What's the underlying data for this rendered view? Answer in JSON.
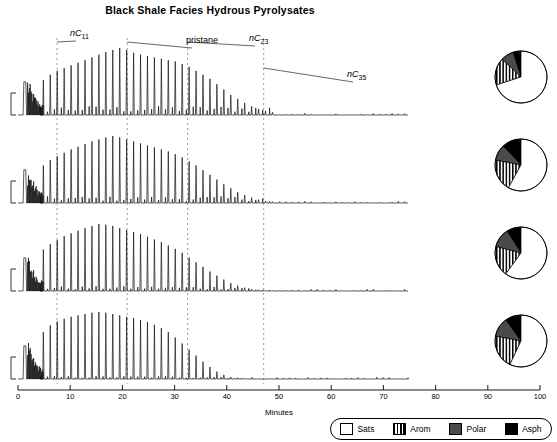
{
  "title": "Black Shale Facies Hydrous Pyrolysates",
  "axis": {
    "xlabel": "Minutes",
    "xticks": [
      0,
      10,
      20,
      30,
      40,
      50,
      60,
      70,
      80,
      90,
      100
    ],
    "xmin": 0,
    "xmax": 100
  },
  "annotations": [
    {
      "name": "nC11",
      "text": "nC",
      "sub": "11",
      "x": 10,
      "label_x": 70,
      "label_y": 28
    },
    {
      "name": "pristane",
      "text": "pristane",
      "sub": "",
      "x": 28,
      "label_x": 186,
      "label_y": 35
    },
    {
      "name": "nC23",
      "text": "nC",
      "sub": "23",
      "x": 43.5,
      "label_x": 249,
      "label_y": 33
    },
    {
      "name": "nC35",
      "text": "nC",
      "sub": "35",
      "x": 63,
      "label_x": 347,
      "label_y": 69
    }
  ],
  "guide_lines": [
    10,
    28,
    43.5,
    63
  ],
  "legend": {
    "items": [
      {
        "key": "sats",
        "label": "Sats"
      },
      {
        "key": "arom",
        "label": "Arom"
      },
      {
        "key": "polar",
        "label": "Polar"
      },
      {
        "key": "asph",
        "label": "Asph"
      }
    ]
  },
  "colors": {
    "trace": "#111111",
    "guide": "#9a9a9a",
    "axis": "#000000",
    "polar": "#4a4a4a",
    "asph": "#000000"
  },
  "chart_data": {
    "type": "line",
    "title": "Black Shale Facies Hydrous Pyrolysates",
    "xlabel": "Minutes",
    "ylabel": "",
    "xlim": [
      0,
      100
    ],
    "grid": false,
    "legend_position": "bottom-right",
    "panels": [
      {
        "name": "300C",
        "label": "300°C/72 hours",
        "alkane_start": 6.5,
        "alkane_spacing": 1.78,
        "alkane_count": 34,
        "unresolved_hump": 0.3,
        "peak_envelope": [
          0.52,
          0.6,
          0.66,
          0.7,
          0.74,
          0.78,
          0.82,
          0.86,
          0.9,
          0.94,
          0.97,
          1.0,
          0.97,
          0.93,
          0.9,
          0.88,
          0.86,
          0.84,
          0.82,
          0.8,
          0.76,
          0.72,
          0.66,
          0.6,
          0.54,
          0.46,
          0.38,
          0.3,
          0.24,
          0.18,
          0.13,
          0.09,
          0.06,
          0.04
        ],
        "pie": {
          "sats": 70,
          "arom": 17,
          "polar": 8,
          "asph": 5
        }
      },
      {
        "name": "330C",
        "label": "330°C/72 hours",
        "alkane_start": 6.5,
        "alkane_spacing": 1.78,
        "alkane_count": 34,
        "unresolved_hump": 0.22,
        "peak_envelope": [
          0.56,
          0.64,
          0.7,
          0.75,
          0.8,
          0.84,
          0.88,
          0.92,
          0.95,
          0.98,
          1.0,
          0.98,
          0.95,
          0.92,
          0.89,
          0.86,
          0.83,
          0.8,
          0.77,
          0.73,
          0.68,
          0.62,
          0.56,
          0.49,
          0.42,
          0.35,
          0.28,
          0.22,
          0.16,
          0.12,
          0.08,
          0.05,
          0.03,
          0.02
        ],
        "pie": {
          "sats": 58,
          "arom": 20,
          "polar": 10,
          "asph": 12
        }
      },
      {
        "name": "345C",
        "label": "345°C/72 hours",
        "alkane_start": 6.5,
        "alkane_spacing": 1.78,
        "alkane_count": 34,
        "unresolved_hump": 0.16,
        "peak_envelope": [
          0.62,
          0.7,
          0.76,
          0.82,
          0.86,
          0.9,
          0.94,
          0.97,
          1.0,
          0.99,
          0.97,
          0.94,
          0.91,
          0.88,
          0.85,
          0.81,
          0.77,
          0.73,
          0.68,
          0.63,
          0.57,
          0.5,
          0.43,
          0.36,
          0.29,
          0.23,
          0.17,
          0.12,
          0.08,
          0.05,
          0.03,
          0.02,
          0.01,
          0.01
        ],
        "pie": {
          "sats": 60,
          "arom": 19,
          "polar": 12,
          "asph": 9
        }
      },
      {
        "name": "360C",
        "label": "360°C/72 hours",
        "alkane_start": 6.5,
        "alkane_spacing": 1.78,
        "alkane_count": 30,
        "unresolved_hump": 0.1,
        "peak_envelope": [
          0.7,
          0.8,
          0.86,
          0.9,
          0.93,
          0.95,
          0.97,
          0.99,
          1.0,
          0.99,
          0.97,
          0.95,
          0.93,
          0.91,
          0.88,
          0.85,
          0.81,
          0.76,
          0.7,
          0.62,
          0.53,
          0.44,
          0.35,
          0.26,
          0.18,
          0.11,
          0.06,
          0.03,
          0.02,
          0.01
        ],
        "pie": {
          "sats": 57,
          "arom": 21,
          "polar": 12,
          "asph": 10
        }
      }
    ]
  }
}
